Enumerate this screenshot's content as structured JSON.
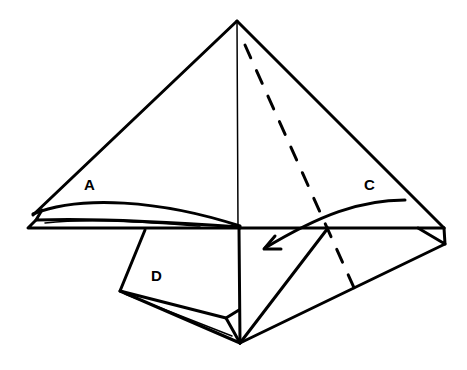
{
  "diagram": {
    "type": "origami-fold-step",
    "labels": {
      "a": "A",
      "c": "C",
      "d": "D"
    },
    "colors": {
      "line": "#000000",
      "background": "#ffffff"
    },
    "annotations": {
      "arrow": "curved arrow folding flap C toward the center-left",
      "valley_fold": "dashed line from apex to lower right"
    }
  }
}
